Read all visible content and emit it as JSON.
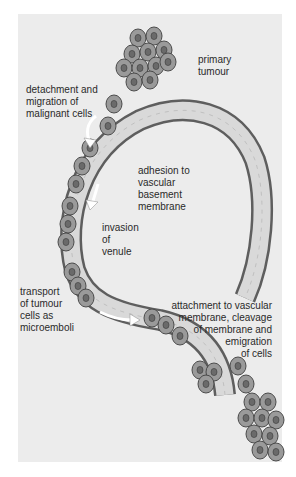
{
  "diagram": {
    "type": "biological-process",
    "colors": {
      "background": "#ffffff",
      "panel": "#ececec",
      "vessel_wall": "#6e6e6e",
      "vessel_lumen": "#d8d8d8",
      "cell_fill": "#9a9a9a",
      "cell_nucleus": "#6a6a6a",
      "arrow": "#ffffff",
      "text": "#2a2a2a"
    },
    "labels": {
      "primary_tumour": "primary\ntumour",
      "detachment": "detachment and\nmigration of\nmalignant cells",
      "adhesion": "adhesion to\nvascular\nbasement\nmembrane",
      "invasion": "invasion\nof\nvenule",
      "transport": "transport\nof tumour\ncells as\nmicroemboli",
      "attachment": "attachment to vascular\nmembrane, cleavage\nof membrane and\nemigration\nof cells"
    }
  }
}
